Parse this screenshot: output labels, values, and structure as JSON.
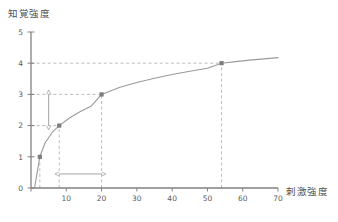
{
  "chart_data": {
    "type": "line",
    "title": "",
    "subtitle": "",
    "xlabel": "刺激強度",
    "ylabel": "知覚強度",
    "xlim": [
      0,
      70
    ],
    "ylim": [
      0,
      5
    ],
    "xticks": [
      0,
      10,
      20,
      30,
      40,
      50,
      60,
      70
    ],
    "xticklabels": [
      "",
      "10",
      "20",
      "30",
      "40",
      "50",
      "60",
      "70"
    ],
    "yticks": [
      0,
      1,
      2,
      3,
      4,
      5
    ],
    "yticklabels": [
      "0",
      "1",
      "2",
      "3",
      "4",
      "5"
    ],
    "grid": false,
    "legend": null,
    "series": [
      {
        "name": "知覚強度曲線",
        "kind": "curve",
        "description": "logarithmic Weber-Fechner curve",
        "x": [
          1.0,
          2.5,
          4,
          6,
          8,
          11,
          14,
          17,
          20,
          25,
          30,
          35,
          40,
          45,
          50,
          54,
          58,
          62,
          66,
          70
        ],
        "y": [
          0.0,
          1.0,
          1.45,
          1.78,
          2.0,
          2.25,
          2.45,
          2.62,
          3.0,
          3.22,
          3.38,
          3.52,
          3.64,
          3.74,
          3.84,
          4.0,
          4.05,
          4.1,
          4.14,
          4.18
        ]
      }
    ],
    "points": [
      {
        "label": "P1",
        "x": 2.5,
        "y": 1
      },
      {
        "label": "P2",
        "x": 8,
        "y": 2
      },
      {
        "label": "P3",
        "x": 20,
        "y": 3
      },
      {
        "label": "P4",
        "x": 54,
        "y": 4
      }
    ],
    "guide_lines": [
      {
        "kind": "horizontal",
        "y": 2,
        "x_from": 0,
        "x_to": 8,
        "style": "dashed"
      },
      {
        "kind": "horizontal",
        "y": 3,
        "x_from": 0,
        "x_to": 20,
        "style": "dashed"
      },
      {
        "kind": "horizontal",
        "y": 4,
        "x_from": 0,
        "x_to": 54,
        "style": "dashed"
      },
      {
        "kind": "vertical",
        "x": 2.5,
        "y_from": 0,
        "y_to": 1,
        "style": "dashed"
      },
      {
        "kind": "vertical",
        "x": 8,
        "y_from": 0,
        "y_to": 2,
        "style": "dashed"
      },
      {
        "kind": "vertical",
        "x": 20,
        "y_from": 0,
        "y_to": 3,
        "style": "dashed"
      },
      {
        "kind": "vertical",
        "x": 54,
        "y_from": 0,
        "y_to": 4,
        "style": "dashed"
      }
    ],
    "annotations": [
      {
        "kind": "double-arrow",
        "orientation": "vertical",
        "x": 5,
        "y_from": 2,
        "y_to": 3,
        "label": ""
      },
      {
        "kind": "double-arrow",
        "orientation": "horizontal",
        "y": 0.45,
        "x_from": 8,
        "x_to": 20,
        "label": ""
      }
    ],
    "colors": {
      "axis": "#808080",
      "curve": "#9a9a9a",
      "point": "#7d7d7d",
      "dashed": "#b4b4b4",
      "arrow": "#9a9a9a",
      "text": "#4d4d4d",
      "background": "#ffffff"
    }
  }
}
